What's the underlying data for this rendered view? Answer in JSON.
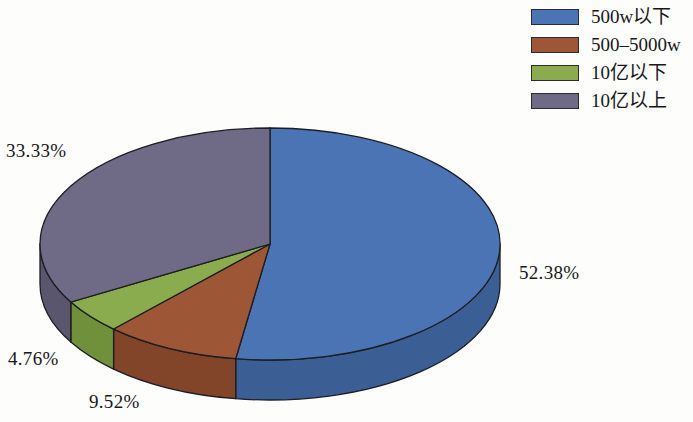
{
  "chart_data": {
    "type": "pie",
    "title": "",
    "subtitle": "",
    "xlabel": "",
    "ylabel": "",
    "legend_position": "right",
    "grid": false,
    "three_d": true,
    "start_angle_deg": 0,
    "direction": "clockwise",
    "categories": [
      "500w以下",
      "500–5000w",
      "10亿以下",
      "10亿以上"
    ],
    "values": [
      52.38,
      9.52,
      4.76,
      33.33
    ],
    "value_labels": [
      "52.38%",
      "9.52%",
      "4.76%",
      "33.33%"
    ],
    "colors": [
      "#4a74b4",
      "#9e5736",
      "#8aab4e",
      "#6f6b86"
    ],
    "slices": [
      {
        "label": "500w以下",
        "value": 52.38,
        "value_label": "52.38%",
        "color": "#4a74b4",
        "side_color": "#3b5e94",
        "start_deg": 0,
        "sweep_deg": 188.57
      },
      {
        "label": "500–5000w",
        "value": 9.52,
        "value_label": "9.52%",
        "color": "#9e5736",
        "side_color": "#82452a",
        "start_deg": 188.57,
        "sweep_deg": 34.28
      },
      {
        "label": "10亿以下",
        "value": 4.76,
        "value_label": "4.76%",
        "color": "#8aab4e",
        "side_color": "#71903c",
        "start_deg": 222.85,
        "sweep_deg": 17.14
      },
      {
        "label": "10亿以上",
        "value": 33.33,
        "value_label": "33.33%",
        "color": "#6f6b86",
        "side_color": "#5a566e",
        "start_deg": 240.0,
        "sweep_deg": 120.0
      }
    ]
  },
  "labels": {
    "top_left": "33.33%",
    "right": "52.38%",
    "bottom_left": "4.76%",
    "bottom": "9.52%"
  },
  "legend": {
    "items": [
      {
        "label": "500w以下",
        "color": "#4a74b4"
      },
      {
        "label": "500–5000w",
        "color": "#9e5736"
      },
      {
        "label": "10亿以下",
        "color": "#8aab4e"
      },
      {
        "label": "10亿以上",
        "color": "#6f6b86"
      }
    ]
  }
}
